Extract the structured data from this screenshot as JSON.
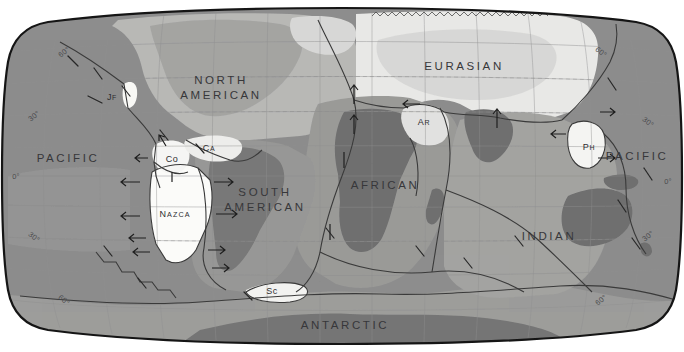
{
  "map": {
    "title": "Tectonic Plates of the World",
    "projection": "Robinson",
    "style": "grayscale",
    "width": 684,
    "height": 352,
    "colors": {
      "background": "#ffffff",
      "ocean_pacific": "#8c8c8c",
      "ocean_mid": "#a8a8a8",
      "ocean_light": "#bdbdbd",
      "plate_eurasian": "#e8e8e6",
      "plate_north_american": "#b9b9b7",
      "plate_african": "#9a9a98",
      "plate_indian": "#a3a3a1",
      "plate_antarctic": "#9e9e9c",
      "plate_small_light": "#f4f4f2",
      "landmass_dark": "#6e6e6e",
      "graticule": "#8e8e8e",
      "outline": "#1d1d1d",
      "label": "#2e2e30"
    }
  },
  "plates": {
    "major": [
      {
        "id": "pacific-west",
        "label": "PACIFIC",
        "lines": [
          "PACIFIC"
        ],
        "x": 68,
        "y": 158
      },
      {
        "id": "pacific-east",
        "label": "PACIFIC",
        "lines": [
          "PACIFIC"
        ],
        "x": 637,
        "y": 156
      },
      {
        "id": "north-american",
        "label": "NORTH AMERICAN",
        "lines": [
          "NORTH",
          "AMERICAN"
        ],
        "x": 221,
        "y": 88
      },
      {
        "id": "south-american",
        "label": "SOUTH AMERICAN",
        "lines": [
          "SOUTH",
          "AMERICAN"
        ],
        "x": 265,
        "y": 200
      },
      {
        "id": "eurasian",
        "label": "EURASIAN",
        "lines": [
          "EURASIAN"
        ],
        "x": 464,
        "y": 66
      },
      {
        "id": "african",
        "label": "AFRICAN",
        "lines": [
          "AFRICAN"
        ],
        "x": 385,
        "y": 185
      },
      {
        "id": "indian",
        "label": "INDIAN",
        "lines": [
          "INDIAN"
        ],
        "x": 549,
        "y": 236
      },
      {
        "id": "antarctic",
        "label": "ANTARCTIC",
        "lines": [
          "ANTARCTIC"
        ],
        "x": 345,
        "y": 325
      }
    ],
    "minor": [
      {
        "id": "juan-de-fuca",
        "label": "JF",
        "head": "J",
        "tail": "F",
        "x": 112,
        "y": 97,
        "kind": "smallcaps"
      },
      {
        "id": "cocos",
        "label": "Co",
        "head": "C",
        "tail": "o",
        "x": 172,
        "y": 159,
        "kind": "plain"
      },
      {
        "id": "caribbean",
        "label": "CA",
        "head": "C",
        "tail": "A",
        "x": 209,
        "y": 148,
        "kind": "smallcaps"
      },
      {
        "id": "nazca",
        "label": "NAZCA",
        "head": "N",
        "tail": "AZCA",
        "x": 175,
        "y": 214,
        "kind": "nazca"
      },
      {
        "id": "scotia",
        "label": "Sc",
        "head": "S",
        "tail": "c",
        "x": 272,
        "y": 291,
        "kind": "plain"
      },
      {
        "id": "arabian",
        "label": "AR",
        "head": "A",
        "tail": "R",
        "x": 424,
        "y": 122,
        "kind": "smallcaps"
      },
      {
        "id": "philippine",
        "label": "PH",
        "head": "P",
        "tail": "H",
        "x": 589,
        "y": 147,
        "kind": "smallcaps"
      }
    ]
  },
  "graticule": {
    "latitude_labels": [
      {
        "id": "lat-60n-left",
        "text": "60°",
        "x": 64,
        "y": 52,
        "rot": "rot-l"
      },
      {
        "id": "lat-30n-left",
        "text": "30°",
        "x": 34,
        "y": 116,
        "rot": "rot-l"
      },
      {
        "id": "lat-0-left",
        "text": "0°",
        "x": 16,
        "y": 176,
        "rot": ""
      },
      {
        "id": "lat-30s-left",
        "text": "30°",
        "x": 34,
        "y": 237,
        "rot": "rot-lb"
      },
      {
        "id": "lat-60s-left",
        "text": "60°",
        "x": 64,
        "y": 300,
        "rot": "rot-lb"
      },
      {
        "id": "lat-60n-right",
        "text": "60°",
        "x": 601,
        "y": 52,
        "rot": "rot-r"
      },
      {
        "id": "lat-30n-right",
        "text": "30°",
        "x": 648,
        "y": 122,
        "rot": "rot-r"
      },
      {
        "id": "lat-0-right",
        "text": "0°",
        "x": 668,
        "y": 181,
        "rot": ""
      },
      {
        "id": "lat-30s-right",
        "text": "30°",
        "x": 648,
        "y": 236,
        "rot": "rot-rb"
      },
      {
        "id": "lat-60s-right",
        "text": "60°",
        "x": 601,
        "y": 300,
        "rot": "rot-rb"
      }
    ],
    "parallels": [
      52,
      84,
      116,
      148,
      176,
      205,
      237,
      268,
      300
    ],
    "meridians": 13
  },
  "boundary_markers": {
    "legend": "arrows indicate relative plate motion",
    "divergent_arrows": [
      {
        "x": 180,
        "y": 182,
        "dir": "left"
      },
      {
        "x": 206,
        "y": 182,
        "dir": "right"
      },
      {
        "x": 182,
        "y": 216,
        "dir": "left"
      },
      {
        "x": 213,
        "y": 216,
        "dir": "right"
      },
      {
        "x": 186,
        "y": 238,
        "dir": "left"
      },
      {
        "x": 214,
        "y": 252,
        "dir": "right"
      },
      {
        "x": 193,
        "y": 178,
        "dir": "left"
      },
      {
        "x": 355,
        "y": 95,
        "dir": "up"
      },
      {
        "x": 355,
        "y": 122,
        "dir": "up"
      },
      {
        "x": 497,
        "y": 112,
        "dir": "up"
      },
      {
        "x": 497,
        "y": 134,
        "dir": "down"
      },
      {
        "x": 420,
        "y": 104,
        "dir": "left"
      }
    ],
    "transform_ticks": [
      {
        "x": 72,
        "y": 61
      },
      {
        "x": 98,
        "y": 73
      },
      {
        "x": 94,
        "y": 100
      },
      {
        "x": 125,
        "y": 90
      },
      {
        "x": 160,
        "y": 135
      },
      {
        "x": 197,
        "y": 148
      },
      {
        "x": 330,
        "y": 232
      },
      {
        "x": 420,
        "y": 250
      },
      {
        "x": 468,
        "y": 262
      },
      {
        "x": 519,
        "y": 240
      },
      {
        "x": 612,
        "y": 84
      },
      {
        "x": 622,
        "y": 206
      },
      {
        "x": 636,
        "y": 243
      },
      {
        "x": 648,
        "y": 174
      }
    ]
  }
}
